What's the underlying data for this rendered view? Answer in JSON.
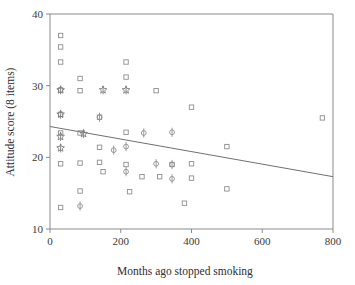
{
  "chart_data": {
    "type": "scatter",
    "title": "",
    "xlabel": "Months ago stopped smoking",
    "ylabel": "Attitude score (8 items)",
    "xlim": [
      0,
      800
    ],
    "ylim": [
      10,
      40
    ],
    "xticks": [
      0,
      200,
      400,
      600,
      800
    ],
    "yticks": [
      10,
      20,
      30,
      40
    ],
    "xtick_labels": [
      "0",
      "200",
      "400",
      "600",
      "800"
    ],
    "ytick_labels": [
      "10",
      "20",
      "30",
      "40"
    ],
    "grid": false,
    "legend": "none",
    "marker_kinds": {
      "square": "open-square",
      "phi": "circle-with-vertical-bar",
      "star": "star-overlap"
    },
    "series": [
      {
        "name": "observations-square",
        "marker": "square",
        "points": [
          [
            30,
            37.0
          ],
          [
            30,
            35.4
          ],
          [
            30,
            33.3
          ],
          [
            30,
            29.4
          ],
          [
            30,
            26.0
          ],
          [
            30,
            23.4
          ],
          [
            30,
            19.1
          ],
          [
            30,
            13.0
          ],
          [
            85,
            31.0
          ],
          [
            85,
            29.3
          ],
          [
            85,
            23.4
          ],
          [
            85,
            19.2
          ],
          [
            85,
            15.3
          ],
          [
            140,
            25.6
          ],
          [
            140,
            21.4
          ],
          [
            140,
            19.3
          ],
          [
            150,
            18.0
          ],
          [
            215,
            33.3
          ],
          [
            215,
            31.2
          ],
          [
            215,
            23.5
          ],
          [
            215,
            19.0
          ],
          [
            225,
            15.2
          ],
          [
            260,
            17.3
          ],
          [
            300,
            29.3
          ],
          [
            310,
            17.3
          ],
          [
            345,
            19.0
          ],
          [
            380,
            13.6
          ],
          [
            400,
            27.0
          ],
          [
            400,
            19.1
          ],
          [
            400,
            17.1
          ],
          [
            500,
            21.5
          ],
          [
            500,
            15.6
          ],
          [
            770,
            25.5
          ]
        ]
      },
      {
        "name": "observations-phi",
        "marker": "phi",
        "points": [
          [
            85,
            13.2
          ],
          [
            140,
            25.6
          ],
          [
            180,
            21.0
          ],
          [
            215,
            21.5
          ],
          [
            215,
            18.0
          ],
          [
            265,
            23.4
          ],
          [
            300,
            19.1
          ],
          [
            345,
            23.5
          ],
          [
            345,
            19.0
          ],
          [
            345,
            17.0
          ]
        ]
      },
      {
        "name": "observations-star",
        "marker": "star",
        "points": [
          [
            30,
            29.4
          ],
          [
            30,
            26.0
          ],
          [
            30,
            22.9
          ],
          [
            30,
            21.3
          ],
          [
            95,
            23.3
          ],
          [
            150,
            29.4
          ],
          [
            215,
            29.4
          ]
        ]
      }
    ],
    "fit_line": {
      "name": "regression-line",
      "x0": 0,
      "y0": 24.3,
      "x1": 800,
      "y1": 17.3
    }
  }
}
